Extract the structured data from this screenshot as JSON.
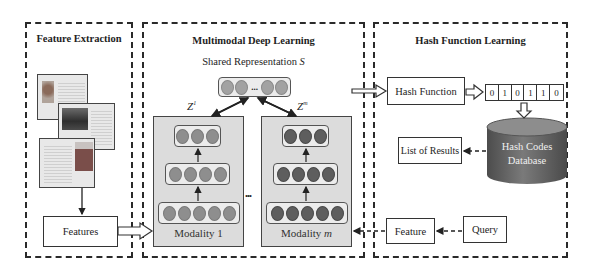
{
  "panels": {
    "feature_extraction": {
      "title": "Feature Extraction",
      "features_label": "Features",
      "documents": [
        "document-1",
        "document-2",
        "document-3"
      ]
    },
    "multimodal": {
      "title": "Multimodal Deep Learning",
      "shared_label": "Shared Representation ",
      "shared_symbol": "S",
      "shared_ellipsis": "...",
      "z1_label": "Z",
      "z1_sup": "1",
      "zm_label": "Z",
      "zm_sup": "m",
      "between_modalities": "...",
      "modality_1": {
        "label_prefix": "Modality ",
        "label_index": "1",
        "layers": [
          3,
          4,
          5
        ]
      },
      "modality_m": {
        "label_prefix": "Modality ",
        "label_index": "m",
        "layers": [
          3,
          4,
          5
        ]
      }
    },
    "hash": {
      "title": "Hash Function Learning",
      "hash_function_label": "Hash Function",
      "bits": [
        "0",
        "1",
        "0",
        "1",
        "1",
        "0"
      ],
      "database_line1": "Hash Codes",
      "database_line2": "Database",
      "results_label": "List of Results",
      "feature_label": "Feature",
      "query_label": "Query"
    }
  },
  "colors": {
    "dashed_border": "#2a2a2a",
    "modality_bg": "#dcdcdc",
    "node_light": "#8e8e8e",
    "node_dark": "#5e5e5e",
    "database": "#6a6a6a"
  }
}
